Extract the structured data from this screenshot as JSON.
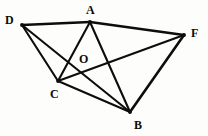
{
  "figure": {
    "canvas": {
      "width": 208,
      "height": 136
    },
    "background_color": "#fdfdfb",
    "line_color": "#0d0d0d",
    "label_color": "#0b0b0b",
    "points": [
      {
        "id": "A",
        "label": "A",
        "x": 90,
        "y": 22,
        "label_x": 86,
        "label_y": 4,
        "type": "vertex"
      },
      {
        "id": "D",
        "label": "D",
        "x": 22,
        "y": 25,
        "label_x": 5,
        "label_y": 14,
        "type": "vertex"
      },
      {
        "id": "F",
        "label": "F",
        "x": 184,
        "y": 35,
        "label_x": 191,
        "label_y": 27,
        "type": "vertex"
      },
      {
        "id": "C",
        "label": "C",
        "x": 58,
        "y": 81,
        "label_x": 50,
        "label_y": 88,
        "type": "vertex"
      },
      {
        "id": "B",
        "label": "B",
        "x": 130,
        "y": 112,
        "label_x": 134,
        "label_y": 119,
        "type": "vertex"
      },
      {
        "id": "O",
        "label": "O",
        "x": 83,
        "y": 61,
        "label_x": 79,
        "label_y": 53,
        "type": "interior-point"
      }
    ],
    "edges": [
      {
        "id": "DA",
        "from": "D",
        "to": "A",
        "weight": "thick"
      },
      {
        "id": "AF",
        "from": "A",
        "to": "F",
        "weight": "thick"
      },
      {
        "id": "DC",
        "from": "D",
        "to": "C",
        "weight": "normal"
      },
      {
        "id": "DB",
        "from": "D",
        "to": "B",
        "weight": "normal"
      },
      {
        "id": "AC",
        "from": "A",
        "to": "C",
        "weight": "normal"
      },
      {
        "id": "AB",
        "from": "A",
        "to": "B",
        "weight": "normal"
      },
      {
        "id": "CB",
        "from": "C",
        "to": "B",
        "weight": "normal"
      },
      {
        "id": "CF",
        "from": "C",
        "to": "F",
        "weight": "normal"
      },
      {
        "id": "BF",
        "from": "B",
        "to": "F",
        "weight": "thick"
      }
    ]
  }
}
